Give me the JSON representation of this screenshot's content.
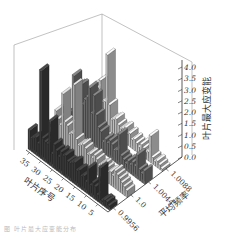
{
  "chart_data": {
    "type": "bar3d",
    "title": "",
    "xlabel": "叶片序号",
    "ylabel": "平均频率",
    "zlabel": "叶片最大应变能",
    "x_ticks": [
      "5",
      "10",
      "15",
      "20",
      "25",
      "30",
      "35"
    ],
    "y_ticks": [
      "0.9956",
      "1.0",
      "1.0044",
      "1.0088"
    ],
    "z_ticks": [
      "0.0",
      "0.5",
      "1.0",
      "1.5",
      "2.0",
      "2.5",
      "3.0",
      "3.5",
      "4.0"
    ],
    "zlim": [
      0,
      4.0
    ],
    "xlim": [
      1,
      36
    ],
    "series": [
      {
        "name": "0.9956",
        "color": "#3a3a3a",
        "values": [
          0.2,
          0.3,
          0.3,
          0.2,
          1.6,
          0.3,
          0.6,
          0.7,
          0.5,
          1.2,
          0.5,
          0.7,
          0.6,
          0.8,
          0.7,
          1.0,
          0.9,
          0.8,
          0.8,
          1.0,
          0.9,
          1.0,
          0.7,
          0.9,
          1.1,
          0.6,
          2.0,
          0.9,
          0.9,
          1.0,
          4.0,
          0.6,
          0.8,
          0.7,
          0.6,
          0.9
        ]
      },
      {
        "name": "1.0",
        "color": "#b8b8b8",
        "values": [
          0.3,
          0.4,
          0.5,
          0.6,
          0.7,
          0.8,
          0.5,
          0.6,
          0.5,
          0.6,
          0.7,
          0.6,
          0.5,
          0.7,
          0.8,
          0.6,
          0.7,
          0.6,
          0.8,
          0.9,
          0.8,
          0.7,
          0.9,
          3.3,
          1.0,
          0.9,
          1.2,
          1.3,
          2.5,
          1.0,
          1.2,
          1.5,
          0.7,
          0.6,
          0.4,
          0.5
        ]
      },
      {
        "name": "1.0044",
        "color": "#6e6e6e",
        "values": [
          0.6,
          0.4,
          0.5,
          1.1,
          0.5,
          0.6,
          0.4,
          0.5,
          0.3,
          0.4,
          0.5,
          1.4,
          0.6,
          0.5,
          0.7,
          0.8,
          0.6,
          0.7,
          0.5,
          0.9,
          1.0,
          1.5,
          2.3,
          1.4,
          2.5,
          2.0,
          1.8,
          1.5,
          2.3,
          2.2,
          1.4,
          2.5,
          0.8,
          0.6,
          0.5,
          0.4
        ]
      },
      {
        "name": "1.0088",
        "color": "#c8c8c8",
        "values": [
          0.1,
          0.2,
          0.3,
          0.2,
          0.3,
          1.2,
          0.4,
          0.3,
          0.4,
          0.5,
          0.3,
          0.4,
          0.5,
          0.4,
          0.6,
          0.5,
          0.7,
          0.6,
          0.5,
          0.6,
          0.8,
          0.7,
          0.6,
          1.2,
          3.4,
          1.2,
          1.1,
          2.0,
          1.6,
          1.7,
          1.3,
          1.2,
          0.9,
          0.6,
          0.4,
          0.3
        ]
      }
    ],
    "grid": false,
    "legend": "none"
  },
  "caption": "图 叶片最大应变能分布"
}
